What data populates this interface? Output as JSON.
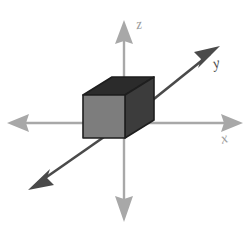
{
  "figure": {
    "canvas": {
      "width": 250,
      "height": 231,
      "background": "#ffffff"
    },
    "axes": {
      "x": {
        "label": "x",
        "color": "#a8a8a8",
        "orientation": "horizontal",
        "double_headed": true,
        "line": {
          "x1": 10,
          "y1": 123,
          "x2": 240,
          "y2": 123
        },
        "label_position": {
          "x": 221,
          "y": 131
        }
      },
      "z": {
        "label": "z",
        "color": "#a8a8a8",
        "orientation": "vertical",
        "double_headed": true,
        "line": {
          "x1": 124,
          "y1": 24,
          "x2": 124,
          "y2": 214
        },
        "label_position": {
          "x": 136,
          "y": 17
        }
      },
      "y": {
        "label": "y",
        "color": "#4a4a4a",
        "orientation": "diagonal",
        "double_headed": true,
        "line": {
          "x1": 33,
          "y1": 187,
          "x2": 215,
          "y2": 50
        },
        "label_position": {
          "x": 213,
          "y": 56
        }
      }
    },
    "box": {
      "name": "shaded-rectangular-box",
      "outline_color": "#1e1e1e",
      "faces": {
        "front": {
          "name": "front-face",
          "color": "#7d7d7d"
        },
        "top": {
          "name": "top-face",
          "color": "#2b2b2b"
        },
        "right": {
          "name": "right-face",
          "color": "#3c3c3c"
        }
      },
      "front_rect": {
        "x": 83,
        "y": 95,
        "width": 42,
        "height": 43
      },
      "depth_offset": {
        "dx": 29,
        "dy": -18
      }
    },
    "origin": {
      "x": 124,
      "y": 123
    }
  }
}
